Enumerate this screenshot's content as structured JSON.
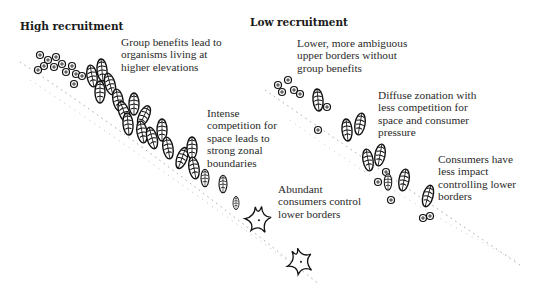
{
  "headings": {
    "high": "High recruitment",
    "low": "Low recruitment"
  },
  "annotations": {
    "high_group_benefits": [
      "Group benefits lead to",
      "organisms living at",
      "higher elevations"
    ],
    "high_competition": [
      "Intense",
      "competition for",
      "space leads to",
      "strong zonal",
      "boundaries"
    ],
    "high_consumers": [
      "Abundant",
      "consumers control",
      "lower borders"
    ],
    "low_upper_borders": [
      "Lower, more ambiguous",
      "upper borders without",
      "group benefits"
    ],
    "low_diffuse": [
      "Diffuse zonation with",
      "less competition for",
      "space and consumer",
      "pressure"
    ],
    "low_consumers": [
      "Consumers have",
      "less impact",
      "controlling lower",
      "borders"
    ]
  },
  "icons": {
    "organisms": [
      "barnacle-icon",
      "mussel-icon",
      "sea-star-icon"
    ]
  },
  "colors": {
    "ink": "#1a1a1a",
    "text": "#2a2a2a",
    "background": "#ffffff"
  }
}
